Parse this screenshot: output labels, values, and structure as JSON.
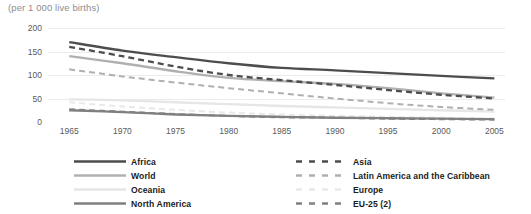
{
  "chart_data": {
    "type": "line",
    "title": "(per 1 000 live births)",
    "xlabel": "",
    "ylabel": "",
    "x": [
      1965,
      1970,
      1975,
      1980,
      1985,
      1990,
      1995,
      2000,
      2005
    ],
    "xlim": [
      1963,
      2006
    ],
    "ylim": [
      0,
      200
    ],
    "yticks": [
      200,
      150,
      100,
      50,
      0
    ],
    "xticks": [
      "1965",
      "1970",
      "1975",
      "1980",
      "1985",
      "1990",
      "1995",
      "2000",
      "2005"
    ],
    "grid": "horizontal",
    "legend_position": "bottom",
    "legend_columns": 2,
    "series": [
      {
        "name": "Africa",
        "style": "solid",
        "color": "#4d4d4d",
        "width": 2.3,
        "values": [
          170,
          152,
          138,
          125,
          115,
          110,
          104,
          98,
          93
        ]
      },
      {
        "name": "Asia",
        "style": "dashed",
        "color": "#4d4d4d",
        "width": 2.3,
        "values": [
          160,
          140,
          118,
          100,
          89,
          79,
          68,
          58,
          50
        ]
      },
      {
        "name": "World",
        "style": "solid",
        "color": "#b0b0b0",
        "width": 2.3,
        "values": [
          140,
          125,
          108,
          94,
          87,
          81,
          72,
          61,
          52
        ]
      },
      {
        "name": "Latin America and the Caribbean",
        "style": "dashed",
        "color": "#b0b0b0",
        "width": 2.0,
        "values": [
          112,
          97,
          84,
          72,
          61,
          50,
          40,
          32,
          26
        ]
      },
      {
        "name": "Oceania",
        "style": "solid",
        "color": "#e6e6e6",
        "width": 2.3,
        "values": [
          48,
          46,
          42,
          38,
          34,
          31,
          28,
          25,
          22
        ]
      },
      {
        "name": "Europe",
        "style": "dashed",
        "color": "#e9e9e9",
        "width": 2.0,
        "values": [
          42,
          33,
          26,
          20,
          16,
          13,
          11,
          9,
          7
        ]
      },
      {
        "name": "North America",
        "style": "solid",
        "color": "#808080",
        "width": 2.3,
        "values": [
          25,
          21,
          16,
          13,
          11,
          9,
          8,
          7,
          6
        ]
      },
      {
        "name": "EU-25 (2)",
        "style": "dashed",
        "color": "#808080",
        "width": 2.0,
        "values": [
          27,
          22,
          17,
          13,
          10,
          9,
          7,
          6,
          5
        ]
      }
    ]
  },
  "legend": {
    "items": [
      {
        "label": "Africa",
        "series": 0,
        "column": 0,
        "row": 0
      },
      {
        "label": "World",
        "series": 2,
        "column": 0,
        "row": 1
      },
      {
        "label": "Oceania",
        "series": 4,
        "column": 0,
        "row": 2
      },
      {
        "label": "North America",
        "series": 6,
        "column": 0,
        "row": 3
      },
      {
        "label": "Asia",
        "series": 1,
        "column": 1,
        "row": 0
      },
      {
        "label": "Latin America and the Caribbean",
        "series": 3,
        "column": 1,
        "row": 1
      },
      {
        "label": "Europe",
        "series": 5,
        "column": 1,
        "row": 2
      },
      {
        "label": "EU-25 (2)",
        "series": 7,
        "column": 1,
        "row": 3
      }
    ]
  },
  "colors": {
    "grid": "#ebebeb",
    "tick_text": "#5a5a5a",
    "title_text": "#8d8d8d",
    "legend_text": "#1c1c1c",
    "background": "#ffffff"
  }
}
